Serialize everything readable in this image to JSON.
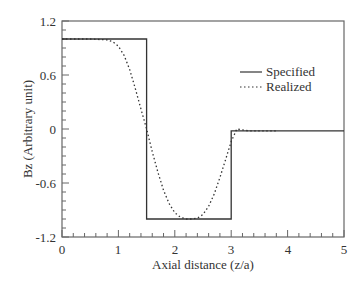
{
  "chart_data": {
    "type": "line",
    "title": "",
    "xlabel": "Axial distance (z/a)",
    "ylabel": "Bz (Arbitrary unit)",
    "xlim": [
      0,
      5
    ],
    "ylim": [
      -1.2,
      1.2
    ],
    "x_ticks": [
      "0",
      "1",
      "2",
      "3",
      "4",
      "5"
    ],
    "y_ticks": [
      "1.2",
      "0.6",
      "0",
      "-0.6",
      "-1.2"
    ],
    "grid": false,
    "legend_position": "upper right",
    "series": [
      {
        "name": "Specified",
        "style": "solid",
        "x": [
          0,
          1.5,
          1.5,
          3.0,
          3.0,
          5.0
        ],
        "y": [
          1.0,
          1.0,
          -1.0,
          -1.0,
          -0.02,
          -0.02
        ]
      },
      {
        "name": "Realized",
        "style": "dotted",
        "x": [
          0,
          0.5,
          0.8,
          0.9,
          1.0,
          1.1,
          1.2,
          1.3,
          1.4,
          1.5,
          1.6,
          1.7,
          1.8,
          1.9,
          2.0,
          2.1,
          2.2,
          2.3,
          2.4,
          2.5,
          2.6,
          2.7,
          2.8,
          2.9,
          3.0,
          3.1,
          3.2,
          3.3,
          3.4,
          3.5,
          3.6,
          3.7,
          3.8
        ],
        "y": [
          1.0,
          1.0,
          0.99,
          0.97,
          0.92,
          0.82,
          0.66,
          0.45,
          0.22,
          0.0,
          -0.25,
          -0.48,
          -0.68,
          -0.83,
          -0.93,
          -0.98,
          -1.0,
          -1.0,
          -0.99,
          -0.95,
          -0.86,
          -0.72,
          -0.54,
          -0.34,
          -0.14,
          0.0,
          -0.01,
          -0.02,
          -0.02,
          -0.02,
          -0.02,
          -0.02,
          -0.02
        ]
      }
    ]
  },
  "legend": {
    "items": [
      {
        "label": "Specified",
        "style": "solid"
      },
      {
        "label": "Realized",
        "style": "dotted"
      }
    ]
  },
  "axes": {
    "xlabel": "Axial distance (z/a)",
    "ylabel": "Bz (Arbitrary unit)",
    "x_ticks": [
      "0",
      "1",
      "2",
      "3",
      "4",
      "5"
    ],
    "y_ticks": [
      "1.2",
      "0.6",
      "0",
      "-0.6",
      "-1.2"
    ]
  },
  "colors": {
    "line": "#333333",
    "axis": "#555555"
  }
}
